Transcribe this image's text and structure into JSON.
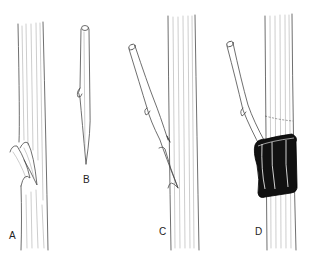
{
  "figure": {
    "panels": [
      {
        "id": "A",
        "label": "A",
        "content": "Rootstock stem with slanted cleft cut and tongue"
      },
      {
        "id": "B",
        "label": "B",
        "content": "Scion cutting with bud, tapered wedge base"
      },
      {
        "id": "C",
        "label": "C",
        "content": "Scion inserted into cleft of rootstock"
      },
      {
        "id": "D",
        "label": "D",
        "content": "Graft union wrapped with black tape/wrap"
      }
    ],
    "colors": {
      "background": "#ffffff",
      "line": "#4a4a4a",
      "hatch": "#9a9a9a",
      "wrap": "#111111"
    }
  }
}
